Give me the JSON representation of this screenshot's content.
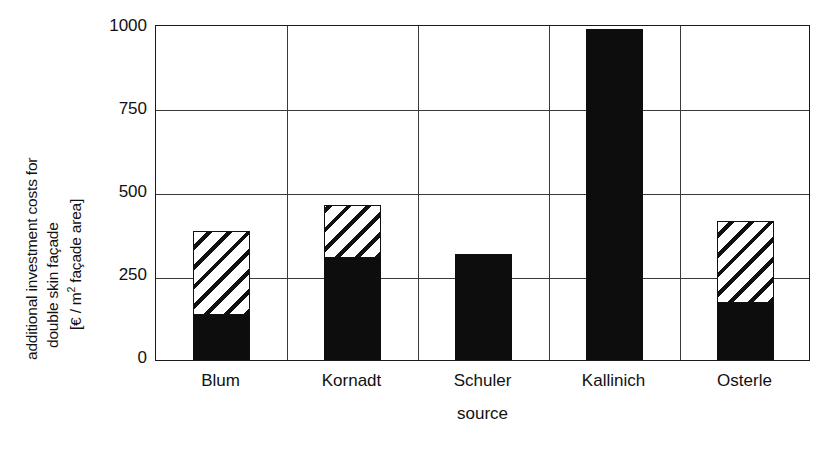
{
  "chart_data": {
    "type": "bar",
    "stacked": true,
    "title": "",
    "xlabel": "source",
    "ylabel": "additional investment costs for double skin façade [€ / m² façade area]",
    "ylabel_lines": [
      "additional investment costs for",
      "double skin façade",
      "[€ / m² façade area]"
    ],
    "categories": [
      "Blum",
      "Kornadt",
      "Schuler",
      "Kallinich",
      "Osterle"
    ],
    "ylim": [
      0,
      1000
    ],
    "yticks": [
      1000,
      750,
      500,
      250,
      0
    ],
    "ytick_labels": [
      "1000",
      "750",
      "500",
      "250",
      "0"
    ],
    "grid": "horizontal-and-category-dividers",
    "legend": "none",
    "series": [
      {
        "name": "lower range (solid black)",
        "fill": "solid-black",
        "color": "#0d0d0d",
        "values": [
          135,
          305,
          315,
          985,
          170
        ]
      },
      {
        "name": "upper range (hatched)",
        "fill": "diagonal-hatch",
        "color": "#ffffff",
        "values": [
          250,
          155,
          0,
          0,
          245
        ]
      }
    ],
    "totals": [
      385,
      460,
      315,
      985,
      415
    ]
  },
  "axis": {
    "y_unit_superscript": "2"
  },
  "colors": {
    "ink": "#111111",
    "grid": "#3a3a3a",
    "bar_solid": "#0d0d0d",
    "background": "#ffffff"
  }
}
